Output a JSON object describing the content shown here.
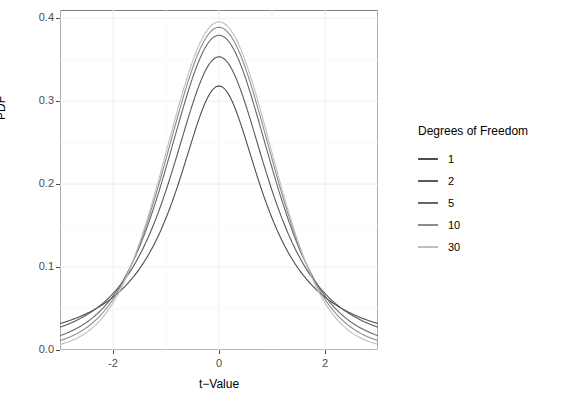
{
  "chart_data": {
    "type": "line",
    "title": "",
    "xlabel": "t−Value",
    "ylabel": "PDF",
    "xlim": [
      -3,
      3
    ],
    "ylim": [
      0,
      0.41
    ],
    "xticks": [
      "-2",
      "0",
      "2"
    ],
    "xtick_values": [
      -2,
      0,
      2
    ],
    "yticks": [
      "0.0",
      "0.1",
      "0.2",
      "0.3",
      "0.4"
    ],
    "ytick_values": [
      0.0,
      0.1,
      0.2,
      0.3,
      0.4
    ],
    "grid": true,
    "grid_minor": true,
    "legend_position": "right",
    "legend_title": "Degrees of Freedom",
    "x": [
      -3,
      -2.8,
      -2.6,
      -2.4,
      -2.2,
      -2,
      -1.8,
      -1.6,
      -1.4,
      -1.2,
      -1,
      -0.8,
      -0.6,
      -0.4,
      -0.2,
      0,
      0.2,
      0.4,
      0.6,
      0.8,
      1,
      1.2,
      1.4,
      1.6,
      1.8,
      2,
      2.2,
      2.4,
      2.6,
      2.8,
      3
    ],
    "series": [
      {
        "name": "1",
        "color": "#4d4d4d",
        "peak": 0.3183,
        "values": [
          0.0318,
          0.0361,
          0.0413,
          0.0476,
          0.0553,
          0.0637,
          0.0745,
          0.0872,
          0.103,
          0.122,
          0.1592,
          0.194,
          0.2343,
          0.2744,
          0.306,
          0.3183,
          0.306,
          0.2744,
          0.2343,
          0.194,
          0.1592,
          0.122,
          0.103,
          0.0872,
          0.0745,
          0.0637,
          0.0553,
          0.0476,
          0.0413,
          0.0361,
          0.0318
        ]
      },
      {
        "name": "2",
        "color": "#595959",
        "peak": 0.3536,
        "values": [
          0.0274,
          0.0325,
          0.0388,
          0.0468,
          0.057,
          0.068,
          0.0841,
          0.1022,
          0.1261,
          0.1562,
          0.1924,
          0.232,
          0.2719,
          0.306,
          0.3322,
          0.3536,
          0.3322,
          0.306,
          0.2719,
          0.232,
          0.1924,
          0.1562,
          0.1261,
          0.1022,
          0.0841,
          0.068,
          0.057,
          0.0468,
          0.0388,
          0.0325,
          0.0274
        ]
      },
      {
        "name": "5",
        "color": "#666666",
        "peak": 0.3796,
        "values": [
          0.0173,
          0.0222,
          0.0287,
          0.0373,
          0.0488,
          0.0651,
          0.0851,
          0.1115,
          0.1452,
          0.1861,
          0.2197,
          0.2616,
          0.3009,
          0.3332,
          0.3577,
          0.3796,
          0.3577,
          0.3332,
          0.3009,
          0.2616,
          0.2197,
          0.1861,
          0.1452,
          0.1115,
          0.0851,
          0.0651,
          0.0488,
          0.0373,
          0.0287,
          0.0222,
          0.0173
        ]
      },
      {
        "name": "10",
        "color": "#8c8c8c",
        "peak": 0.3891,
        "values": [
          0.0114,
          0.016,
          0.0225,
          0.0316,
          0.0441,
          0.0611,
          0.0836,
          0.1123,
          0.1474,
          0.188,
          0.2304,
          0.272,
          0.3083,
          0.3367,
          0.3605,
          0.3891,
          0.3605,
          0.3367,
          0.3083,
          0.272,
          0.2304,
          0.188,
          0.1474,
          0.1123,
          0.0836,
          0.0611,
          0.0441,
          0.0316,
          0.0225,
          0.016,
          0.0114
        ]
      },
      {
        "name": "30",
        "color": "#bfbfbf",
        "peak": 0.396,
        "values": [
          0.0066,
          0.0103,
          0.0159,
          0.024,
          0.0356,
          0.0516,
          0.0732,
          0.1011,
          0.1357,
          0.1765,
          0.2213,
          0.265,
          0.303,
          0.332,
          0.354,
          0.396,
          0.354,
          0.332,
          0.303,
          0.265,
          0.2213,
          0.1765,
          0.1357,
          0.1011,
          0.0732,
          0.0516,
          0.0356,
          0.024,
          0.0159,
          0.0103,
          0.0066
        ]
      }
    ]
  },
  "legend": {
    "title": "Degrees of Freedom",
    "items": [
      {
        "label": "1",
        "color": "#4d4d4d"
      },
      {
        "label": "2",
        "color": "#595959"
      },
      {
        "label": "5",
        "color": "#666666"
      },
      {
        "label": "10",
        "color": "#8c8c8c"
      },
      {
        "label": "30",
        "color": "#bfbfbf"
      }
    ]
  },
  "axes": {
    "y_label": "PDF",
    "x_label": "t−Value"
  },
  "style": {
    "panel_border": "#7f7f7f",
    "grid_major": "#f0f0f0",
    "grid_minor": "#f7f7f7",
    "tick_text": "#4d4d4d",
    "background": "#ffffff"
  }
}
